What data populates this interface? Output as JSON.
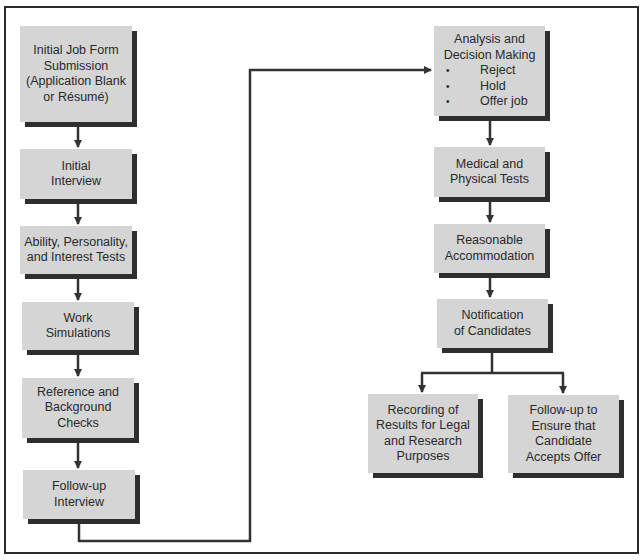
{
  "diagram": {
    "type": "flowchart",
    "colors": {
      "box_fill": "#d4d5d4",
      "box_shadow": "#2e2e2e",
      "line": "#333333",
      "frame": "#2b2b2b",
      "text": "#2a2a2a"
    },
    "left_column": [
      {
        "id": "initial-job-form",
        "lines": [
          "Initial Job Form",
          "Submission",
          "(Application Blank",
          "or Résumé)"
        ]
      },
      {
        "id": "initial-interview",
        "lines": [
          "Initial",
          "Interview"
        ]
      },
      {
        "id": "ability-tests",
        "lines": [
          "Ability, Personality,",
          "and Interest Tests"
        ]
      },
      {
        "id": "work-simulations",
        "lines": [
          "Work",
          "Simulations"
        ]
      },
      {
        "id": "reference-checks",
        "lines": [
          "Reference and",
          "Background",
          "Checks"
        ]
      },
      {
        "id": "follow-up-interview",
        "lines": [
          "Follow-up",
          "Interview"
        ]
      }
    ],
    "right_column": [
      {
        "id": "analysis-decision",
        "lines": [
          "Analysis and",
          "Decision Making"
        ],
        "bullet_symbol": "•",
        "bullets": [
          "Reject",
          "Hold",
          "Offer job"
        ]
      },
      {
        "id": "medical-tests",
        "lines": [
          "Medical and",
          "Physical Tests"
        ]
      },
      {
        "id": "reasonable-accommodation",
        "lines": [
          "Reasonable",
          "Accommodation"
        ]
      },
      {
        "id": "notification",
        "lines": [
          "Notification",
          "of Candidates"
        ]
      }
    ],
    "branches": [
      {
        "id": "recording-results",
        "lines": [
          "Recording of",
          "Results for Legal",
          "and Research",
          "Purposes"
        ]
      },
      {
        "id": "follow-up-offer",
        "lines": [
          "Follow-up to",
          "Ensure that",
          "Candidate",
          "Accepts Offer"
        ]
      }
    ],
    "edges": [
      [
        "initial-job-form",
        "initial-interview"
      ],
      [
        "initial-interview",
        "ability-tests"
      ],
      [
        "ability-tests",
        "work-simulations"
      ],
      [
        "work-simulations",
        "reference-checks"
      ],
      [
        "reference-checks",
        "follow-up-interview"
      ],
      [
        "follow-up-interview",
        "analysis-decision"
      ],
      [
        "analysis-decision",
        "medical-tests"
      ],
      [
        "medical-tests",
        "reasonable-accommodation"
      ],
      [
        "reasonable-accommodation",
        "notification"
      ],
      [
        "notification",
        "recording-results"
      ],
      [
        "notification",
        "follow-up-offer"
      ]
    ]
  }
}
